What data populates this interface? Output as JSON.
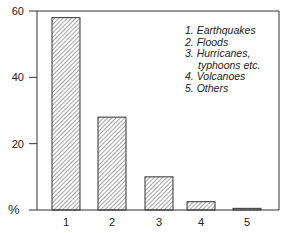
{
  "chart_data": {
    "type": "bar",
    "title": "",
    "xlabel": "",
    "ylabel": "%",
    "categories": [
      "1",
      "2",
      "3",
      "4",
      "5"
    ],
    "values": [
      58,
      28,
      10,
      2.5,
      0.5
    ],
    "ylim": [
      0,
      60
    ],
    "yticks": [
      20,
      40,
      60
    ],
    "grid": false,
    "legend_position": "top-right",
    "legend": [
      "1. Earthquakes",
      "2. Floods",
      "3. Hurricanes,",
      "typhoons etc.",
      "4. Volcanoes",
      "5. Others"
    ],
    "category_names": [
      "Earthquakes",
      "Floods",
      "Hurricanes, typhoons etc.",
      "Volcanoes",
      "Others"
    ],
    "bar_fill": "diagonal hatch",
    "colors": {
      "line": "#222222",
      "background": "#ffffff"
    }
  }
}
